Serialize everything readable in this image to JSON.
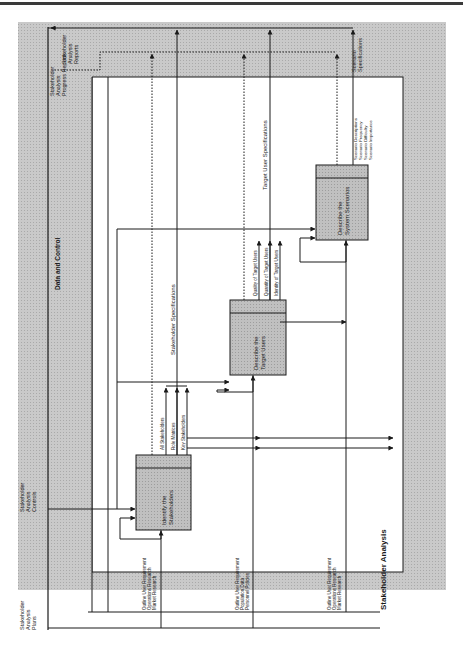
{
  "diagram": {
    "title": "Stakeholder Analysis",
    "band_label": "Data and Control",
    "colors": {
      "frame_fill": "#c4c4c4",
      "box_fill": "#bdbdbd",
      "inner_fill": "#ffffff",
      "line": "#1a1a1a"
    },
    "boundary_labels": {
      "controls_plans": [
        "Stakeholder",
        "Analysis",
        "Plans"
      ],
      "controls_controls": [
        "Stakeholder",
        "Analysis",
        "Controls"
      ],
      "outputs_progress": [
        "Stakeholder",
        "Analysis",
        "Progress Reports"
      ],
      "outputs_reports": [
        "Stakeholder",
        "Analysis",
        "Reports"
      ],
      "outputs_scenario": [
        "Scenario",
        "Specifications"
      ]
    },
    "activities": [
      {
        "id": "A1",
        "label": [
          "Identify the",
          "Stakeholders"
        ]
      },
      {
        "id": "A2",
        "label": [
          "Describe the",
          "Target Users"
        ]
      },
      {
        "id": "A3",
        "label": [
          "Describe the",
          "System Scenarios"
        ]
      }
    ],
    "flows": {
      "a1_inputs": [
        "Outline User Requirement",
        "Operations Research",
        "Market Research"
      ],
      "a2_inputs": [
        "Outline User Requirement",
        "Population Data",
        "Personnel Policies"
      ],
      "a3_inputs": [
        "Outline User Requirement",
        "Operations Research",
        "Market Research"
      ],
      "a1_outputs": [
        "All Stakeholders",
        "Role Matrices",
        "Key Stakeholders"
      ],
      "a2_outputs": [
        "Quality of Target Users",
        "Quantity of Target Users",
        "Identity of Target Users"
      ],
      "a3_outputs": [
        "Scenario Descriptions",
        "Scenario Frequency",
        "Scenario Difficulty",
        "Scenario Importance"
      ],
      "stakeholder_specs": "Stakeholder Specifications",
      "target_user_specs": "Target User Specifications"
    }
  }
}
